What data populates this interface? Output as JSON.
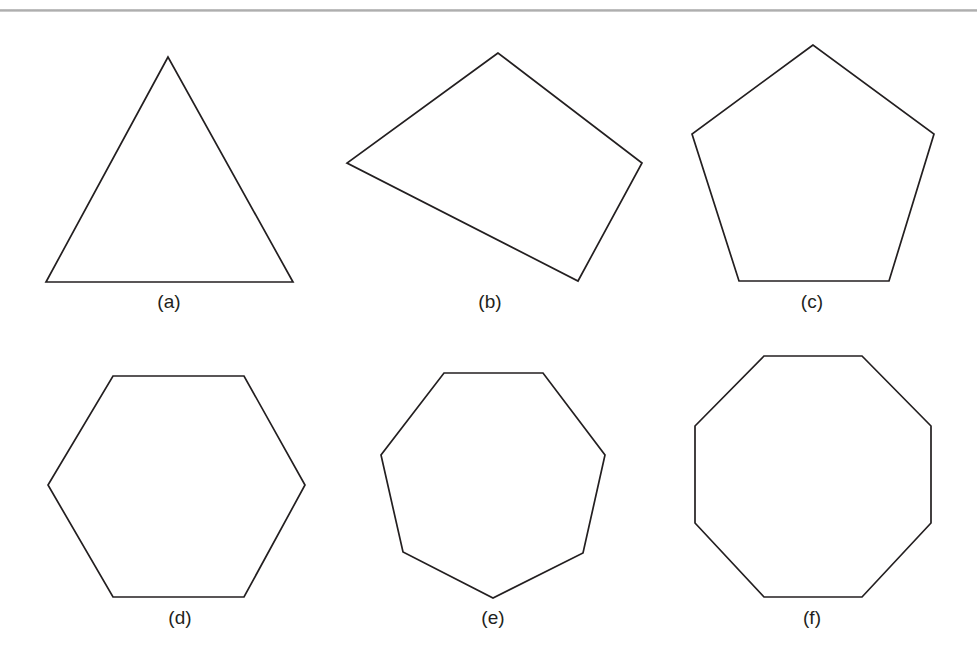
{
  "figure": {
    "background_color": "#ffffff",
    "stroke_color": "#231f20",
    "rule_color": "#aaaaaa",
    "caption_font_size_px": 19,
    "width": 977,
    "height": 662
  },
  "divider": {
    "name": "top-horizontal-rule",
    "y": 9,
    "thickness": 3,
    "color": "#aaaaaa"
  },
  "panels": [
    {
      "key": "a",
      "caption": "(a)",
      "shape_name": "triangle",
      "sides": 3,
      "caption_x": 169,
      "caption_y": 292,
      "points": "168,57 46,282 293,282"
    },
    {
      "key": "b",
      "caption": "(b)",
      "shape_name": "irregular-quadrilateral",
      "sides": 4,
      "caption_x": 490,
      "caption_y": 292,
      "points": "498,53 347,163 578,281 642,163"
    },
    {
      "key": "c",
      "caption": "(c)",
      "shape_name": "pentagon",
      "sides": 5,
      "caption_x": 812,
      "caption_y": 292,
      "points": "813,45 692,134 739,281 889,281 934,134"
    },
    {
      "key": "d",
      "caption": "(d)",
      "shape_name": "hexagon",
      "sides": 6,
      "caption_x": 180,
      "caption_y": 608,
      "points": "113,376 244,376 305,485 244,597 113,597 48,485"
    },
    {
      "key": "e",
      "caption": "(e)",
      "shape_name": "heptagon",
      "sides": 7,
      "caption_x": 493,
      "caption_y": 608,
      "points": "444,373 543,373 605,455 583,553 493,598 403,552 381,455"
    },
    {
      "key": "f",
      "caption": "(f)",
      "shape_name": "octagon",
      "sides": 8,
      "caption_x": 812,
      "caption_y": 608,
      "points": "764,356 862,356 931,426 931,523 862,597 764,597 695,523 695,426"
    }
  ],
  "chart_data": {
    "type": "diagram",
    "title": "",
    "items": [
      {
        "label": "(a)",
        "shape": "triangle",
        "sides": 3,
        "regular": false,
        "row": 1,
        "column": 1
      },
      {
        "label": "(b)",
        "shape": "quadrilateral",
        "sides": 4,
        "regular": false,
        "row": 1,
        "column": 2
      },
      {
        "label": "(c)",
        "shape": "pentagon",
        "sides": 5,
        "regular": true,
        "row": 1,
        "column": 3
      },
      {
        "label": "(d)",
        "shape": "hexagon",
        "sides": 6,
        "regular": true,
        "row": 2,
        "column": 1
      },
      {
        "label": "(e)",
        "shape": "heptagon",
        "sides": 7,
        "regular": true,
        "row": 2,
        "column": 2
      },
      {
        "label": "(f)",
        "shape": "octagon",
        "sides": 8,
        "regular": true,
        "row": 2,
        "column": 3
      }
    ]
  }
}
